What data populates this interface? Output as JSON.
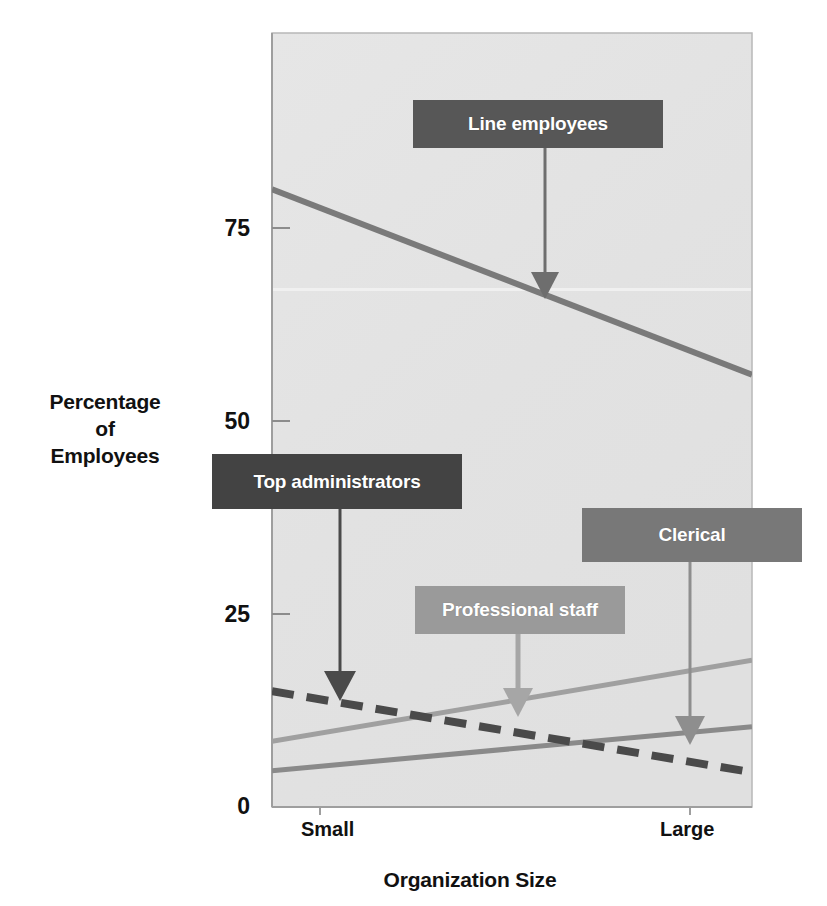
{
  "chart_data": {
    "type": "line",
    "title": "",
    "xlabel": "Organization Size",
    "ylabel": "Percentage\nof\nEmployees",
    "ylabel_lines": [
      "Percentage",
      "of",
      "Employees"
    ],
    "x": [
      "Small",
      "Large"
    ],
    "xtick_labels": [
      "Small",
      "Large"
    ],
    "ytick_labels": [
      "75",
      "50",
      "25",
      "0"
    ],
    "ytick_values": [
      75,
      50,
      25,
      0
    ],
    "ylim": [
      0,
      90
    ],
    "xlim": [
      0,
      1
    ],
    "grid": false,
    "legend_position": "inline-callouts",
    "series": [
      {
        "name": "Line employees",
        "values": [
          80,
          56
        ],
        "style": "solid",
        "color": "#7a7a7a",
        "width": 6
      },
      {
        "name": "Top administrators",
        "values": [
          15,
          4.5
        ],
        "style": "dashed",
        "color": "#4a4a4a",
        "width": 8
      },
      {
        "name": "Professional staff",
        "values": [
          8.5,
          19
        ],
        "style": "solid",
        "color": "#a0a0a0",
        "width": 5
      },
      {
        "name": "Clerical",
        "values": [
          4.7,
          10.4
        ],
        "style": "solid",
        "color": "#8a8a8a",
        "width": 5
      }
    ],
    "annotations": [
      {
        "label": "Line employees",
        "box_color": "#575757",
        "text_color": "#ffffff",
        "arrow_color": "#6e6e6e"
      },
      {
        "label": "Top administrators",
        "box_color": "#434343",
        "text_color": "#ffffff",
        "arrow_color": "#4a4a4a"
      },
      {
        "label": "Clerical",
        "box_color": "#787878",
        "text_color": "#ffffff",
        "arrow_color": "#8a8a8a"
      },
      {
        "label": "Professional staff",
        "box_color": "#9a9a9a",
        "text_color": "#ffffff",
        "arrow_color": "#a6a6a6"
      }
    ]
  },
  "axes": {
    "y_title_line1": "Percentage",
    "y_title_line2": "of",
    "y_title_line3": "Employees",
    "x_title": "Organization Size",
    "y_ticks": [
      {
        "label": "75"
      },
      {
        "label": "50"
      },
      {
        "label": "25"
      },
      {
        "label": "0"
      }
    ],
    "x_ticks": [
      {
        "label": "Small"
      },
      {
        "label": "Large"
      }
    ]
  },
  "callouts": {
    "line_employees": "Line employees",
    "top_administrators": "Top administrators",
    "clerical": "Clerical",
    "professional_staff": "Professional staff"
  },
  "colors": {
    "plot_background": "#e3e3e3",
    "plot_border": "#b5b5b5",
    "axis_text": "#111111",
    "line_employees": "#7a7a7a",
    "top_administrators": "#4a4a4a",
    "professional_staff": "#a0a0a0",
    "clerical": "#8a8a8a",
    "box_dark": "#575757",
    "box_darkest": "#434343",
    "box_mid": "#787878",
    "box_light": "#9a9a9a"
  }
}
